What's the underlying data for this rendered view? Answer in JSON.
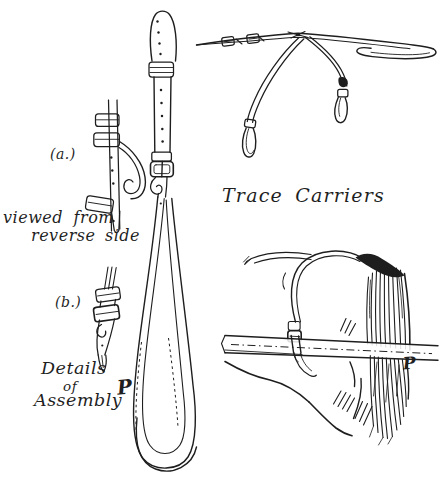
{
  "page": {
    "paper_color": "#ffffff",
    "ink_color": "#1e1e1e"
  },
  "title": "Trace Carriers",
  "labels": {
    "detail_a": "(a.)",
    "detail_b": "(b.)",
    "viewed_from_line1": "viewed from",
    "viewed_from_line2": "reverse side",
    "details_line1": "Details",
    "details_line2": "of",
    "details_line3": "Assembly",
    "artist_monogram": "P"
  },
  "figures": {
    "main_strap": "trace-carrier-strap-front-view",
    "detail_a": "buckle-assembly-reverse-side",
    "detail_b": "strap-end-assembly",
    "carrier_pair": "trace-carriers-on-backband",
    "croup_view": "trace-carrier-over-horse-croup-and-shaft"
  }
}
